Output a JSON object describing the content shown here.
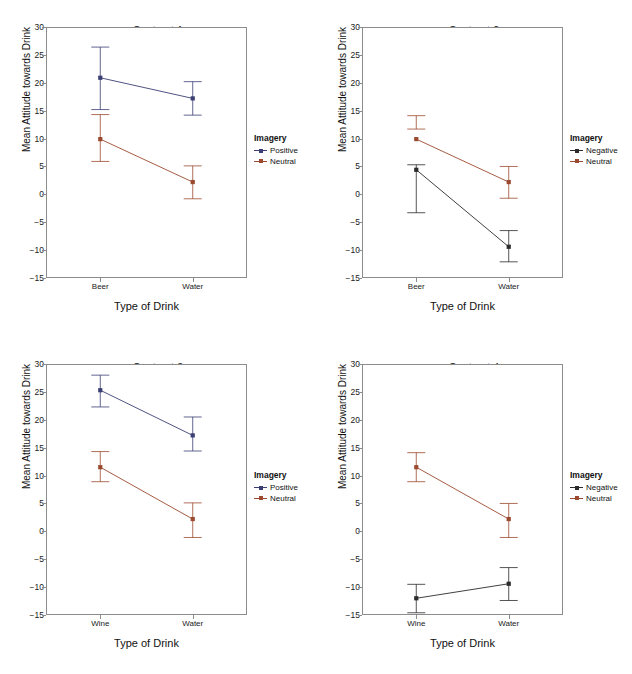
{
  "figure": {
    "width": 632,
    "height": 674,
    "background": "#ffffff",
    "panel_count": 4
  },
  "colors": {
    "positive": "#3b3f73",
    "negative": "#2b2b2b",
    "neutral": "#9c4a2f",
    "axis": "#8c8c8c",
    "text": "#111111"
  },
  "axis": {
    "ylabel": "Mean Attitude towards Drink",
    "xlabel": "Type of Drink",
    "ylim": [
      -15,
      30
    ],
    "yticks": [
      30,
      25,
      20,
      15,
      10,
      5,
      0,
      -5,
      -10,
      -15
    ],
    "ytick_labels": [
      "30",
      "25",
      "20",
      "15",
      "10",
      "5",
      "0",
      "−5",
      "−10",
      "−15"
    ],
    "grid": false
  },
  "legend": {
    "title": "Imagery",
    "position": "right"
  },
  "chart_data": [
    {
      "type": "line",
      "title": "Contrast 1",
      "xlabel": "Type of Drink",
      "ylabel": "Mean Attitude towards Drink",
      "categories": [
        "Beer",
        "Water"
      ],
      "ylim": [
        -15,
        30
      ],
      "yticks": [
        -15,
        -10,
        -5,
        0,
        5,
        10,
        15,
        20,
        25,
        30
      ],
      "legend_title": "Imagery",
      "grid": false,
      "series": [
        {
          "name": "Positive",
          "color": "#3b3f73",
          "values": [
            20.9,
            17.2
          ],
          "error_low": [
            15.2,
            14.2
          ],
          "error_high": [
            26.4,
            20.2
          ]
        },
        {
          "name": "Neutral",
          "color": "#9c4a2f",
          "values": [
            9.9,
            2.2
          ],
          "error_low": [
            5.9,
            -0.8
          ],
          "error_high": [
            14.3,
            5.1
          ]
        }
      ]
    },
    {
      "type": "line",
      "title": "Contrast 2",
      "xlabel": "Type of Drink",
      "ylabel": "Mean Attitude towards Drink",
      "categories": [
        "Beer",
        "Water"
      ],
      "ylim": [
        -15,
        30
      ],
      "yticks": [
        -15,
        -10,
        -5,
        0,
        5,
        10,
        15,
        20,
        25,
        30
      ],
      "legend_title": "Imagery",
      "grid": false,
      "series": [
        {
          "name": "Negative",
          "color": "#2b2b2b",
          "values": [
            4.4,
            -9.4
          ],
          "error_low": [
            -3.3,
            -12.1
          ],
          "error_high": [
            5.3,
            -6.5
          ]
        },
        {
          "name": "Neutral",
          "color": "#9c4a2f",
          "values": [
            9.9,
            2.2
          ],
          "error_low": [
            11.7,
            -0.7
          ],
          "error_high": [
            14.1,
            5.0
          ]
        }
      ]
    },
    {
      "type": "line",
      "title": "Contrast 3",
      "xlabel": "Type of Drink",
      "ylabel": "Mean Attitude towards Drink",
      "categories": [
        "Wine",
        "Water"
      ],
      "ylim": [
        -15,
        30
      ],
      "yticks": [
        -15,
        -10,
        -5,
        0,
        5,
        10,
        15,
        20,
        25,
        30
      ],
      "legend_title": "Imagery",
      "grid": false,
      "series": [
        {
          "name": "Positive",
          "color": "#3b3f73",
          "values": [
            25.3,
            17.2
          ],
          "error_low": [
            22.3,
            14.4
          ],
          "error_high": [
            28.0,
            20.5
          ]
        },
        {
          "name": "Neutral",
          "color": "#9c4a2f",
          "values": [
            11.5,
            2.2
          ],
          "error_low": [
            8.9,
            -1.1
          ],
          "error_high": [
            14.3,
            5.1
          ]
        }
      ]
    },
    {
      "type": "line",
      "title": "Contrast 4",
      "xlabel": "Type of Drink",
      "ylabel": "Mean Attitude towards Drink",
      "categories": [
        "Wine",
        "Water"
      ],
      "ylim": [
        -15,
        30
      ],
      "yticks": [
        -15,
        -10,
        -5,
        0,
        5,
        10,
        15,
        20,
        25,
        30
      ],
      "legend_title": "Imagery",
      "grid": false,
      "series": [
        {
          "name": "Negative",
          "color": "#2b2b2b",
          "values": [
            -12.0,
            -9.4
          ],
          "error_low": [
            -14.6,
            -12.4
          ],
          "error_high": [
            -9.5,
            -6.5
          ]
        },
        {
          "name": "Neutral",
          "color": "#9c4a2f",
          "values": [
            11.5,
            2.2
          ],
          "error_low": [
            8.9,
            -1.1
          ],
          "error_high": [
            14.1,
            5.0
          ]
        }
      ]
    }
  ]
}
